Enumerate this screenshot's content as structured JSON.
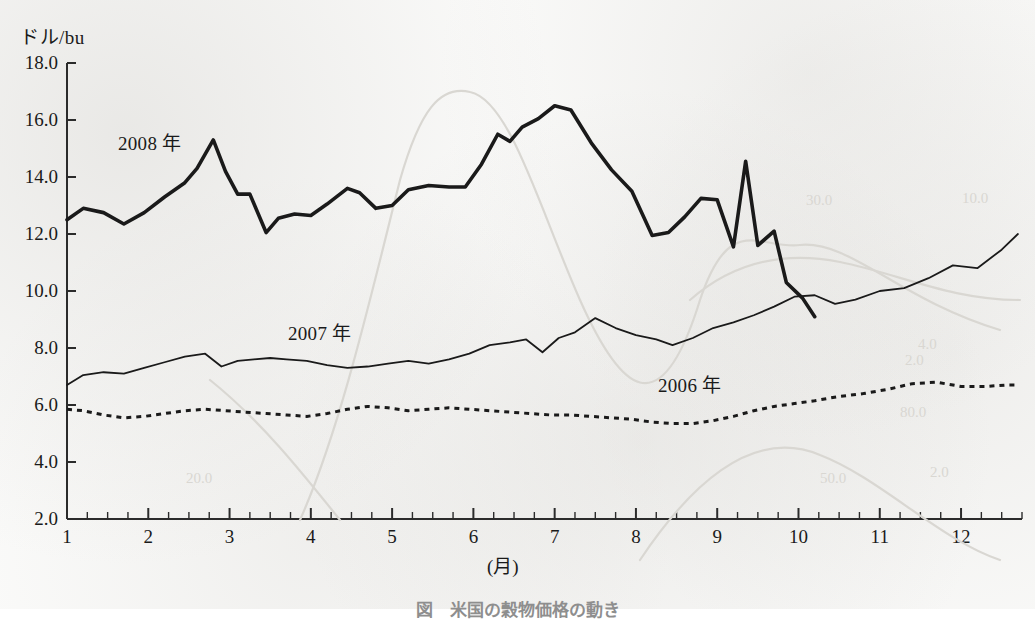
{
  "figure": {
    "caption": "図　米国の穀物価格の動き",
    "y_axis_unit": "ドル/bu",
    "x_axis_unit": "(月)"
  },
  "series_labels": [
    {
      "name": "label-2008",
      "text": "2008 年",
      "x": 118,
      "y": 128
    },
    {
      "name": "label-2007",
      "text": "2007 年",
      "x": 288,
      "y": 318
    },
    {
      "name": "label-2006",
      "text": "2006 年",
      "x": 658,
      "y": 370
    }
  ],
  "colors": {
    "ink": "#1a1a1a",
    "axis": "#2b2b2b",
    "paper": "#fbfbfa",
    "bleed": "#d9d7d2"
  },
  "bleed_text": [
    {
      "text": "30.0",
      "x": 806,
      "y": 192
    },
    {
      "text": "10.0",
      "x": 962,
      "y": 190
    },
    {
      "text": "4.0",
      "x": 918,
      "y": 336
    },
    {
      "text": "2.0",
      "x": 905,
      "y": 352
    },
    {
      "text": "80.0",
      "x": 900,
      "y": 404
    },
    {
      "text": "2.0",
      "x": 930,
      "y": 464
    },
    {
      "text": "50.0",
      "x": 820,
      "y": 470
    },
    {
      "text": "20.0",
      "x": 186,
      "y": 470
    }
  ],
  "chart_data": {
    "type": "line",
    "title": "図　米国の穀物価格の動き",
    "xlabel": "(月)",
    "ylabel": "ドル/bu",
    "xlim": [
      1,
      12.75
    ],
    "ylim": [
      2.0,
      18.0
    ],
    "grid": false,
    "legend": "inline-labels",
    "y_ticks": [
      "2.0",
      "4.0",
      "6.0",
      "8.0",
      "10.0",
      "12.0",
      "14.0",
      "16.0",
      "18.0"
    ],
    "y_tick_values": [
      2.0,
      4.0,
      6.0,
      8.0,
      10.0,
      12.0,
      14.0,
      16.0,
      18.0
    ],
    "x_ticks": [
      "1",
      "2",
      "3",
      "4",
      "5",
      "6",
      "7",
      "8",
      "9",
      "10",
      "11",
      "12"
    ],
    "x_tick_values": [
      1,
      2,
      3,
      4,
      5,
      6,
      7,
      8,
      9,
      10,
      11,
      12
    ],
    "x_minor_tick_step": 0.25,
    "series": [
      {
        "name": "2008 年",
        "style": "thick-solid",
        "line_width": 3.6,
        "color": "#1a1a1a",
        "x": [
          1.0,
          1.2,
          1.45,
          1.7,
          1.95,
          2.2,
          2.45,
          2.6,
          2.8,
          2.95,
          3.1,
          3.25,
          3.45,
          3.6,
          3.8,
          4.0,
          4.2,
          4.45,
          4.6,
          4.8,
          5.0,
          5.2,
          5.45,
          5.7,
          5.9,
          6.1,
          6.3,
          6.45,
          6.6,
          6.8,
          7.0,
          7.2,
          7.45,
          7.7,
          7.95,
          8.2,
          8.4,
          8.6,
          8.8,
          9.0,
          9.2,
          9.35,
          9.5,
          9.7,
          9.85,
          10.05,
          10.2
        ],
        "y": [
          12.5,
          12.9,
          12.75,
          12.35,
          12.75,
          13.3,
          13.8,
          14.3,
          15.3,
          14.2,
          13.4,
          13.4,
          12.05,
          12.55,
          12.7,
          12.65,
          13.05,
          13.6,
          13.45,
          12.9,
          13.0,
          13.55,
          13.7,
          13.65,
          13.65,
          14.45,
          15.5,
          15.25,
          15.75,
          16.05,
          16.5,
          16.35,
          15.2,
          14.25,
          13.5,
          11.95,
          12.05,
          12.6,
          13.25,
          13.2,
          11.55,
          14.55,
          11.6,
          12.1,
          10.3,
          9.75,
          9.1
        ]
      },
      {
        "name": "2007 年",
        "style": "thin-solid",
        "line_width": 1.8,
        "color": "#1a1a1a",
        "x": [
          1.0,
          1.2,
          1.45,
          1.7,
          1.95,
          2.2,
          2.45,
          2.7,
          2.9,
          3.1,
          3.3,
          3.5,
          3.7,
          3.95,
          4.2,
          4.45,
          4.7,
          4.95,
          5.2,
          5.45,
          5.7,
          5.95,
          6.2,
          6.45,
          6.65,
          6.85,
          7.05,
          7.25,
          7.5,
          7.75,
          8.0,
          8.25,
          8.45,
          8.7,
          8.95,
          9.2,
          9.45,
          9.7,
          9.95,
          10.2,
          10.45,
          10.7,
          11.0,
          11.3,
          11.6,
          11.9,
          12.2,
          12.5,
          12.7
        ],
        "y": [
          6.7,
          7.05,
          7.15,
          7.1,
          7.3,
          7.5,
          7.7,
          7.8,
          7.35,
          7.55,
          7.6,
          7.65,
          7.6,
          7.55,
          7.4,
          7.3,
          7.35,
          7.45,
          7.55,
          7.45,
          7.6,
          7.8,
          8.1,
          8.2,
          8.3,
          7.85,
          8.35,
          8.55,
          9.05,
          8.7,
          8.45,
          8.3,
          8.1,
          8.35,
          8.7,
          8.9,
          9.15,
          9.45,
          9.8,
          9.85,
          9.55,
          9.7,
          10.0,
          10.1,
          10.45,
          10.9,
          10.8,
          11.45,
          12.0
        ]
      },
      {
        "name": "2006 年",
        "style": "dotted",
        "line_width": 3.0,
        "dash": "5,5",
        "color": "#1a1a1a",
        "x": [
          1.0,
          1.2,
          1.45,
          1.7,
          1.95,
          2.2,
          2.45,
          2.7,
          2.95,
          3.2,
          3.45,
          3.7,
          3.95,
          4.2,
          4.45,
          4.7,
          4.95,
          5.2,
          5.45,
          5.7,
          5.95,
          6.2,
          6.45,
          6.7,
          6.95,
          7.2,
          7.45,
          7.7,
          7.95,
          8.2,
          8.45,
          8.7,
          8.95,
          9.2,
          9.45,
          9.7,
          9.95,
          10.2,
          10.5,
          10.8,
          11.1,
          11.4,
          11.7,
          12.0,
          12.3,
          12.55,
          12.7
        ],
        "y": [
          5.85,
          5.8,
          5.65,
          5.55,
          5.6,
          5.7,
          5.8,
          5.85,
          5.8,
          5.75,
          5.7,
          5.65,
          5.6,
          5.7,
          5.85,
          5.95,
          5.9,
          5.8,
          5.85,
          5.9,
          5.85,
          5.8,
          5.75,
          5.7,
          5.65,
          5.65,
          5.6,
          5.55,
          5.5,
          5.4,
          5.35,
          5.35,
          5.45,
          5.6,
          5.8,
          5.95,
          6.05,
          6.15,
          6.3,
          6.4,
          6.55,
          6.75,
          6.8,
          6.65,
          6.65,
          6.7,
          6.7
        ]
      }
    ]
  }
}
